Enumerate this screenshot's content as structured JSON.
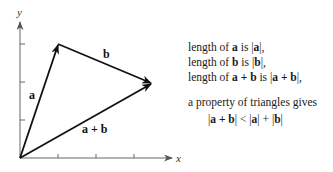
{
  "diagram": {
    "axes": {
      "x_label": "x",
      "y_label": "y"
    },
    "vectors": [
      {
        "name": "a",
        "label": "a",
        "from": [
          0,
          0
        ],
        "to": [
          1,
          3
        ]
      },
      {
        "name": "b",
        "label": "b",
        "from": [
          1,
          3
        ],
        "to": [
          3.5,
          2
        ]
      },
      {
        "name": "a+b",
        "label": "a + b",
        "from": [
          0,
          0
        ],
        "to": [
          3.5,
          2
        ]
      }
    ],
    "ticks": {
      "x": [
        1,
        2,
        3
      ],
      "y": [
        1,
        2,
        3
      ]
    }
  },
  "text": {
    "line1": {
      "pre": "length of ",
      "bold": "a",
      "mid": " is |",
      "bold2": "a",
      "post": "|,"
    },
    "line2": {
      "pre": "length of ",
      "bold": "b",
      "mid": " is |",
      "bold2": "b",
      "post": "|,"
    },
    "line3": {
      "pre": "length of ",
      "bold": "a + b",
      "mid": " is |",
      "bold2": "a + b",
      "post": "|,"
    },
    "line4": "a property of triangles gives",
    "line5": {
      "p1": "|",
      "b1": "a + b",
      "p2": "| < |",
      "b2": "a",
      "p3": "| + |",
      "b3": "b",
      "p4": "|"
    }
  }
}
